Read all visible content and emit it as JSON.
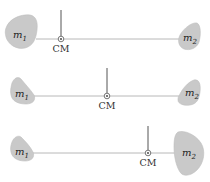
{
  "diagram": {
    "colors": {
      "mass_fill": "#c9c9c9",
      "rod": "#b8b8b8",
      "pointer": "#555555",
      "text": "#222222"
    },
    "panels": [
      {
        "id": "panel-1",
        "case": "m1 larger than m2",
        "mass1": {
          "symbol": "m",
          "subscript": "1",
          "relative_size": "large"
        },
        "mass2": {
          "symbol": "m",
          "subscript": "2",
          "relative_size": "small"
        },
        "cm_label": "CM",
        "cm_position": "closer to m1"
      },
      {
        "id": "panel-2",
        "case": "m1 equal to m2",
        "mass1": {
          "symbol": "m",
          "subscript": "1",
          "relative_size": "equal"
        },
        "mass2": {
          "symbol": "m",
          "subscript": "2",
          "relative_size": "equal"
        },
        "cm_label": "CM",
        "cm_position": "midpoint"
      },
      {
        "id": "panel-3",
        "case": "m2 larger than m1",
        "mass1": {
          "symbol": "m",
          "subscript": "1",
          "relative_size": "small"
        },
        "mass2": {
          "symbol": "m",
          "subscript": "2",
          "relative_size": "large"
        },
        "cm_label": "CM",
        "cm_position": "closer to m2"
      }
    ]
  }
}
